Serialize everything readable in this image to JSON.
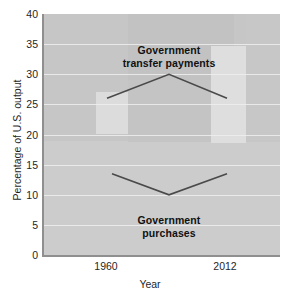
{
  "chart_data": {
    "type": "line",
    "title": "",
    "xlabel": "Year",
    "ylabel": "Percentage of U.S. output",
    "x": [
      1960,
      1986,
      2012
    ],
    "xtick_labels": [
      "1960",
      "2012"
    ],
    "xtick_values": [
      1960,
      2012
    ],
    "ytick_labels": [
      "0",
      "5",
      "10",
      "15",
      "20",
      "25",
      "30",
      "35",
      "40"
    ],
    "ytick_values": [
      0,
      5,
      10,
      15,
      20,
      25,
      30,
      35,
      40
    ],
    "ylim": [
      0,
      40
    ],
    "xlim": [
      1950,
      2022
    ],
    "grid": true,
    "grid_orientation": "horizontal",
    "legend": "none",
    "plot_background": "#c9c9c9",
    "line_color": "#4a4a4a",
    "series": [
      {
        "name": "Government transfer payments",
        "values": [
          26,
          30,
          26
        ],
        "annotation_lines": [
          "Government",
          "transfer payments"
        ]
      },
      {
        "name": "Government purchases",
        "values": [
          13.5,
          10,
          13.5
        ],
        "annotation_lines": [
          "Government",
          "purchases"
        ]
      }
    ]
  },
  "axes": {
    "y_title": "Percentage of U.S. output",
    "x_title": "Year",
    "y_ticks": [
      "40",
      "35",
      "30",
      "25",
      "20",
      "15",
      "10",
      "5",
      "0"
    ],
    "x_ticks": [
      "1960",
      "2012"
    ]
  },
  "annotations": {
    "transfer_line1": "Government",
    "transfer_line2": "transfer payments",
    "purchases_line1": "Government",
    "purchases_line2": "purchases"
  }
}
